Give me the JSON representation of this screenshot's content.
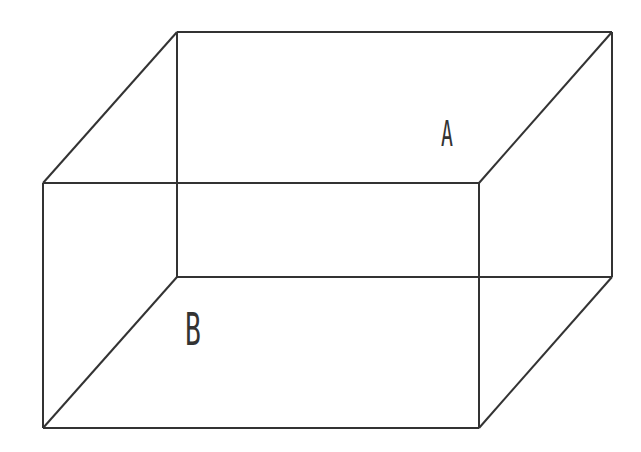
{
  "diagram": {
    "type": "wireframe-box",
    "stroke_color": "#333333",
    "background_color": "#ffffff",
    "back_face": {
      "x1": 177,
      "y1": 32,
      "x2": 612,
      "y2": 277
    },
    "front_face": {
      "x1": 43,
      "y1": 183,
      "x2": 479,
      "y2": 428
    },
    "labels": {
      "a": {
        "text": "A",
        "x": 452,
        "y": 145
      },
      "b": {
        "text": "B",
        "x": 196,
        "y": 330
      }
    }
  }
}
